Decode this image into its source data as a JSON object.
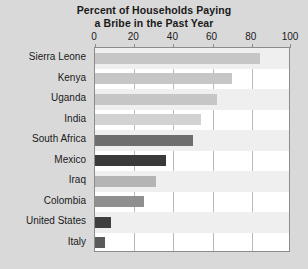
{
  "chart_data": {
    "type": "bar",
    "orientation": "horizontal",
    "title": "Percent of Households Paying a Bribe in the Past Year",
    "title_lines": [
      "Percent of Households Paying",
      "a Bribe in the Past Year"
    ],
    "xlabel": "",
    "ylabel": "",
    "xlim": [
      0,
      100
    ],
    "xticks": [
      0,
      20,
      40,
      60,
      80,
      100
    ],
    "xtick_labels": [
      "0",
      "20",
      "40",
      "60",
      "80",
      "100"
    ],
    "grid": true,
    "legend": "none",
    "categories": [
      "Sierra Leone",
      "Kenya",
      "Uganda",
      "India",
      "South Africa",
      "Mexico",
      "Iraq",
      "Colombia",
      "United States",
      "Italy"
    ],
    "values": [
      84,
      70,
      62,
      54,
      50,
      36,
      31,
      25,
      8,
      5
    ],
    "bar_colors": [
      "#c6c6c6",
      "#c6c6c6",
      "#c6c6c6",
      "#d2d2d2",
      "#6e6e6e",
      "#3a3a3a",
      "#b4b4b4",
      "#8f8f8f",
      "#3f3f3f",
      "#5a5a5a"
    ],
    "plot_background": "#ffffff",
    "page_background": "#d9d9d9",
    "gridline_color": "#b9b9b9",
    "axis_color": "#8c8c8c",
    "band_color": "#efefef",
    "text_color": "#1a1a1a"
  }
}
